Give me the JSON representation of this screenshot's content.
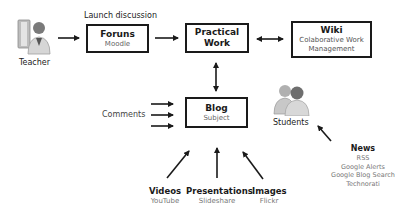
{
  "diagram": {
    "nodes": {
      "teacher": {
        "label": "Teacher",
        "icon": "teacher-person-icon"
      },
      "forums": {
        "title": "Foruns",
        "subtitle": "Moodle",
        "annotation": "Launch discussion"
      },
      "practical_work": {
        "title_line1": "Practical",
        "title_line2": "Work"
      },
      "wiki": {
        "title": "Wiki",
        "subtitle_line1": "Colaborative Work",
        "subtitle_line2": "Management"
      },
      "blog": {
        "title": "Blog",
        "subtitle": "Subject"
      },
      "comments": {
        "label": "Comments"
      },
      "students": {
        "label": "Students",
        "icon": "students-group-icon"
      },
      "videos": {
        "title": "Videos",
        "subtitle": "YouTube"
      },
      "presentations": {
        "title": "Presentations",
        "subtitle": "Slideshare"
      },
      "images": {
        "title": "Images",
        "subtitle": "Flickr"
      },
      "news": {
        "title": "News",
        "items": [
          "RSS",
          "Google Alerts",
          "Google Blog Search",
          "Technorati"
        ]
      }
    },
    "edges": [
      {
        "from": "teacher",
        "to": "forums",
        "type": "single"
      },
      {
        "from": "forums",
        "to": "practical_work",
        "type": "single"
      },
      {
        "from": "practical_work",
        "to": "wiki",
        "type": "double"
      },
      {
        "from": "practical_work",
        "to": "blog",
        "type": "double"
      },
      {
        "from": "comments",
        "to": "blog",
        "type": "single",
        "count": 3
      },
      {
        "from": "videos",
        "to": "blog",
        "type": "single"
      },
      {
        "from": "presentations",
        "to": "blog",
        "type": "single"
      },
      {
        "from": "images",
        "to": "blog",
        "type": "single"
      },
      {
        "from": "news",
        "to": "students",
        "type": "single"
      }
    ],
    "colors": {
      "line": "#1a1a1a",
      "subtext": "#777777"
    }
  }
}
